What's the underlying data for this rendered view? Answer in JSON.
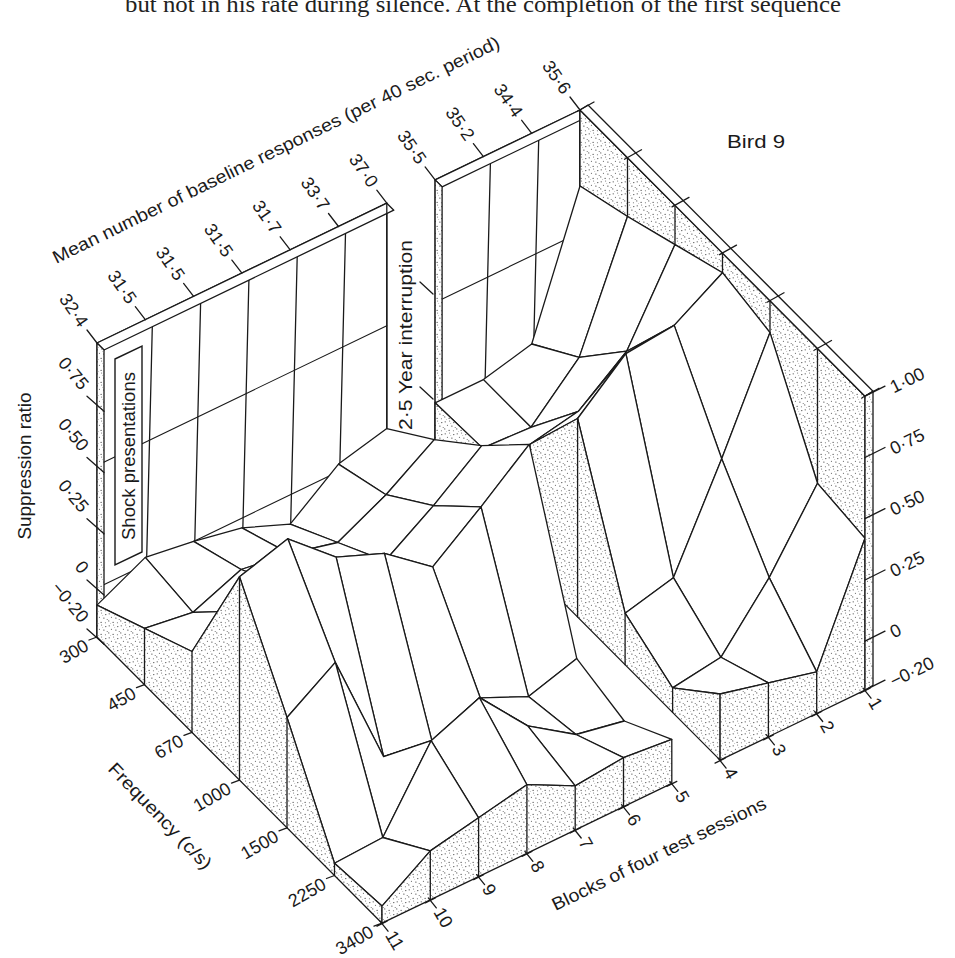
{
  "page": {
    "body_text": "but not in his rate during silence.  At the completion of the first sequence"
  },
  "chart_data": {
    "type": "heatmap",
    "render_style": "isometric 3D surface",
    "title": "Bird 9",
    "x": [
      300,
      450,
      670,
      1000,
      1500,
      2250,
      3400
    ],
    "x_tick_labels": [
      "300",
      "450",
      "670",
      "1000",
      "1500",
      "2250",
      "3400"
    ],
    "xlabel": "Frequency (c/s)",
    "y": [
      1,
      2,
      3,
      4,
      5,
      6,
      7,
      8,
      9,
      10,
      11
    ],
    "y_tick_labels": [
      "1",
      "2",
      "3",
      "4",
      "5",
      "6",
      "7",
      "8",
      "9",
      "10",
      "11"
    ],
    "ylabel": "Blocks of four test sessions",
    "zlabel": "Suppression ratio",
    "zlim": [
      -0.2,
      1.0
    ],
    "z_ticks_left": [
      0.75,
      0.5,
      0.25,
      0,
      -0.2
    ],
    "z_tick_labels_left": [
      "0·75",
      "0·50",
      "0·25",
      "0",
      "−0·20"
    ],
    "z_ticks_right": [
      1.0,
      0.75,
      0.5,
      0.25,
      0,
      -0.2
    ],
    "z_tick_labels_right": [
      "1·00",
      "0·75",
      "0·50",
      "0·25",
      "0",
      "−0·20"
    ],
    "z_note": "rows = blocks 1..11, columns = frequencies 300..3400 c/s (values estimated from the drawing)",
    "z": [
      [
        0.69,
        0.76,
        0.84,
        0.92,
        0.87,
        0.45,
        0.42
      ],
      [
        0.14,
        0.28,
        0.5,
        0.8,
        0.45,
        0.16,
        -0.03
      ],
      [
        0.09,
        0.09,
        0.35,
        0.78,
        0.06,
        -0.07,
        0.02
      ],
      [
        0.09,
        0.1,
        0.31,
        0.61,
        0.01,
        -0.1,
        0.07
      ],
      [
        0.08,
        0.23,
        0.4,
        0.6,
        -0.08,
        -0.14,
        -0.02
      ],
      [
        0.03,
        0.1,
        0.25,
        0.44,
        -0.14,
        -0.1,
        0.0
      ],
      [
        -0.12,
        0.0,
        0.12,
        0.29,
        -0.05,
        0.03,
        -0.02
      ],
      [
        -0.04,
        0.05,
        0.15,
        0.44,
        -0.13,
        0.24,
        0.08
      ],
      [
        0.0,
        0.08,
        0.2,
        0.52,
        -0.1,
        0.16,
        0.04
      ],
      [
        0.03,
        0.0,
        0.2,
        0.69,
        0.38,
        -0.14,
        0.0
      ],
      [
        -0.07,
        0.03,
        0.13,
        0.63,
        0.25,
        -0.15,
        -0.13
      ]
    ],
    "segments": [
      [
        1,
        4
      ],
      [
        5,
        11
      ]
    ],
    "baseline_axis": {
      "label": "Mean number of baseline responses (per 40 sec. period)",
      "values": [
        35.6,
        34.4,
        35.2,
        35.5,
        37.0,
        33.7,
        31.7,
        31.5,
        31.5,
        31.5,
        32.4
      ],
      "tick_labels": [
        "35·6",
        "34·4",
        "35·2",
        "35·5",
        "37·0",
        "33·7",
        "31·7",
        "31·5",
        "31·5",
        "31·5",
        "32·4"
      ]
    },
    "annotations": {
      "shock": {
        "text": "Shock presentations"
      },
      "interruption": {
        "text": "2·5 Year interruption"
      }
    },
    "wall_gridlines_z": [
      0,
      0.5
    ],
    "grid": false,
    "legend": null,
    "colors": {
      "line": "#1a1a1a",
      "stipple": "#3a3a3a",
      "background": "#ffffff"
    }
  }
}
